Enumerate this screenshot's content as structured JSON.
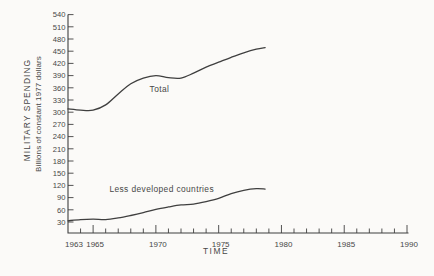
{
  "colors": {
    "background": "#fbfaf8",
    "ink": "#3f3f3f",
    "text": "#474747"
  },
  "chart_data": {
    "type": "line",
    "title": "",
    "xlabel": "TIME",
    "ylabel": "MILITARY SPENDING",
    "ylabel_sub": "Billions of constant 1977 dollars",
    "x_min": 1963,
    "x_max": 1990,
    "y_min": 30,
    "y_max": 540,
    "y_step": 30,
    "x_minor_step": 1,
    "x_major_step": 5,
    "grid": false,
    "legend_position": "inline-labels",
    "x_tick_labels": [
      "1963",
      "1965",
      "1970",
      "1975",
      "1980",
      "1985",
      "1990"
    ],
    "y_tick_labels": [
      "30",
      "60",
      "90",
      "120",
      "150",
      "180",
      "210",
      "240",
      "270",
      "300",
      "330",
      "360",
      "390",
      "420",
      "450",
      "480",
      "510",
      "540"
    ],
    "series": [
      {
        "name": "Total",
        "label": "Total",
        "label_at": {
          "x": 1969.5,
          "y": 350
        },
        "x": [
          1963,
          1964,
          1965,
          1966,
          1967,
          1968,
          1969,
          1970,
          1971,
          1972,
          1973,
          1974,
          1975,
          1976,
          1977,
          1978,
          1978.7
        ],
        "values": [
          308,
          305,
          305,
          318,
          345,
          370,
          384,
          390,
          385,
          384,
          396,
          411,
          423,
          435,
          446,
          455,
          459
        ]
      },
      {
        "name": "Less developed countries",
        "label": "Less developed countries",
        "label_at": {
          "x": 1966.3,
          "y": 104
        },
        "x": [
          1963,
          1964,
          1965,
          1966,
          1967,
          1968,
          1969,
          1970,
          1971,
          1972,
          1973,
          1974,
          1975,
          1976,
          1977,
          1978,
          1978.7
        ],
        "values": [
          33,
          36,
          37,
          36,
          40,
          46,
          53,
          61,
          67,
          72,
          74,
          80,
          88,
          100,
          108,
          112,
          111
        ]
      }
    ]
  }
}
